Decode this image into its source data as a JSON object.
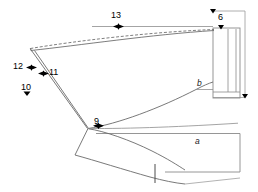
{
  "figure": {
    "type": "technical-line-drawing",
    "background_color": "#ffffff",
    "line_color": "#808080",
    "dark_line_color": "#4d4d4d",
    "marker_color": "#000000",
    "text_color": "#000000",
    "labels": [
      {
        "id": "label-13",
        "text": "13",
        "x": 115,
        "y": 17,
        "kind": "numeric-callout",
        "marker": "double-arrow-horizontal"
      },
      {
        "id": "label-6",
        "text": "6",
        "x": 222,
        "y": 18,
        "kind": "numeric-callout",
        "marker": "arrow-down"
      },
      {
        "id": "label-12",
        "text": "12",
        "x": 16,
        "y": 63,
        "kind": "numeric-callout",
        "marker": "double-arrow-horizontal"
      },
      {
        "id": "label-11",
        "text": "11",
        "x": 47,
        "y": 69,
        "kind": "numeric-callout",
        "marker": "double-arrow-horizontal"
      },
      {
        "id": "label-10",
        "text": "10",
        "x": 22,
        "y": 87,
        "kind": "numeric-callout",
        "marker": "arrow-down"
      },
      {
        "id": "label-9",
        "text": "9",
        "x": 95,
        "y": 118,
        "kind": "numeric-callout",
        "marker": "double-arrow-horizontal"
      },
      {
        "id": "label-b",
        "text": "b",
        "x": 198,
        "y": 83,
        "kind": "region-label",
        "marker": "none"
      },
      {
        "id": "label-a",
        "text": "a",
        "x": 196,
        "y": 141,
        "kind": "region-label",
        "marker": "none"
      }
    ],
    "markers": [
      {
        "id": "marker-13",
        "x": 118,
        "y": 27,
        "type": "double-arrow-horizontal"
      },
      {
        "id": "marker-12",
        "x": 31,
        "y": 68,
        "type": "double-arrow-horizontal"
      },
      {
        "id": "marker-11",
        "x": 43,
        "y": 74,
        "type": "double-arrow-horizontal"
      },
      {
        "id": "marker-9",
        "x": 98,
        "y": 126,
        "type": "double-arrow-horizontal"
      },
      {
        "id": "marker-10",
        "x": 27,
        "y": 94,
        "type": "arrow-down"
      },
      {
        "id": "marker-6",
        "x": 221,
        "y": 27,
        "type": "arrow-down"
      },
      {
        "id": "marker-top-right",
        "x": 213,
        "y": 11,
        "type": "arrow-down"
      },
      {
        "id": "marker-bottom-right",
        "x": 245,
        "y": 98,
        "type": "arrow-down"
      }
    ]
  }
}
